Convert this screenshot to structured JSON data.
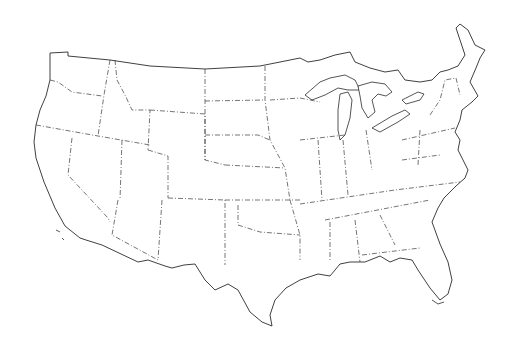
{
  "map": {
    "title": "",
    "type": "blank outline map",
    "region": "Contiguous United States",
    "labels": [],
    "style": {
      "background": "#ffffff",
      "line_color": "#2a2a2a",
      "national_border": "solid",
      "state_border": "dash-dot"
    }
  }
}
